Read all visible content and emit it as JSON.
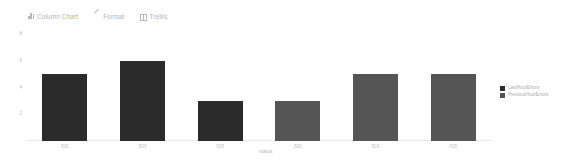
{
  "toolbar": {
    "items": [
      {
        "label": "Column Chart",
        "icon": "bar-chart-icon"
      },
      {
        "label": "Format",
        "icon": "pencil-icon"
      },
      {
        "label": "Trellis",
        "icon": "grid-icon"
      }
    ]
  },
  "legend": {
    "position": "right",
    "entries": [
      {
        "label": "LastHourErrors",
        "color": "#2b2b2b"
      },
      {
        "label": "PreviousHourErrors",
        "color": "#555555"
      }
    ]
  },
  "chart_data": {
    "type": "bar",
    "title": "",
    "subtitle": "",
    "xlabel": "status",
    "ylabel": "",
    "ylim": [
      0,
      8
    ],
    "yticks": [
      2,
      4,
      6,
      8
    ],
    "grid": false,
    "trellis": true,
    "panels": [
      {
        "name": "LastHourErrors",
        "categories": [
          "500",
          "503",
          "505"
        ],
        "values": [
          5,
          6,
          3
        ],
        "color": "#2b2b2b"
      },
      {
        "name": "PreviousHourErrors",
        "categories": [
          "500",
          "503",
          "505"
        ],
        "values": [
          3,
          5,
          5
        ],
        "color": "#555555"
      }
    ],
    "categories": [
      "500",
      "503",
      "505"
    ],
    "series": [
      {
        "name": "LastHourErrors",
        "values": [
          5,
          6,
          3
        ]
      },
      {
        "name": "PreviousHourErrors",
        "values": [
          3,
          5,
          5
        ]
      }
    ]
  }
}
